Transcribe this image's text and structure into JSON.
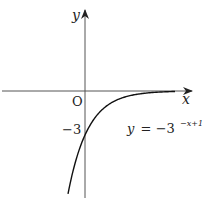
{
  "diagram": {
    "axes": {
      "x_label": "x",
      "y_label": "y",
      "origin_label": "O"
    },
    "y_intercept_label": "−3",
    "equation": {
      "lhs": "y",
      "eq": "= −3",
      "exponent": "−x+1"
    },
    "function": "y = -3^(-x+1)",
    "y_intercept": -3,
    "asymptote": "y = 0"
  }
}
